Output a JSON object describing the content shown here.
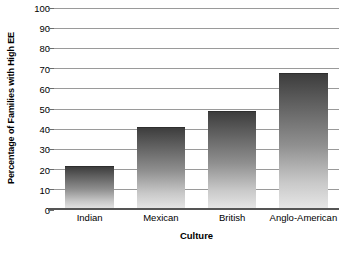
{
  "chart_data": {
    "type": "bar",
    "title": "",
    "categories": [
      "Indian",
      "Mexican",
      "British",
      "Anglo-American"
    ],
    "values": [
      22,
      41,
      49,
      68
    ],
    "xlabel": "Culture",
    "ylabel": "Percentage of Families with High EE",
    "ylim": [
      0,
      100
    ],
    "ytick_step": 10,
    "yticks": [
      0,
      10,
      20,
      30,
      40,
      50,
      60,
      70,
      80,
      90,
      100
    ],
    "ytick_labels": [
      "0",
      "10",
      "20",
      "30",
      "40",
      "50",
      "60",
      "70",
      "80",
      "90",
      "100"
    ],
    "grid": true,
    "grid_axis": "y",
    "legend": false,
    "legend_position": "none",
    "bar_color_top": "#3d3d3d",
    "bar_color_bottom": "#e8e8e8",
    "gridline_color": "#9a9a9a",
    "axis_color": "#555555",
    "background_color": "#ffffff"
  }
}
